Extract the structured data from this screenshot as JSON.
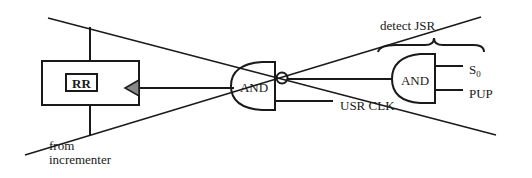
{
  "diagram": {
    "type": "logic-circuit",
    "colors": {
      "stroke": "#1a1a1a",
      "background": "#ffffff",
      "triangle_fill": "#888888"
    },
    "register": {
      "label": "RR"
    },
    "gate_main": {
      "label": "AND"
    },
    "gate_detect": {
      "label": "AND"
    },
    "inputs": {
      "s0_base": "S",
      "s0_sub": "0",
      "pup": "PUP",
      "usr_clk": "USR CLK"
    },
    "annotations": {
      "detect": "detect JSR",
      "from_line1": "from",
      "from_line2": "incrementer"
    },
    "crossed_out": true
  }
}
